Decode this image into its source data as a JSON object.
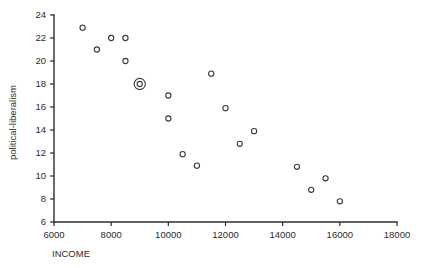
{
  "chart_data": {
    "type": "scatter",
    "title": "",
    "xlabel": "INCOME",
    "ylabel": "political-liberalism",
    "xlim": [
      6000,
      18000
    ],
    "ylim": [
      6,
      24
    ],
    "xticks": [
      6000,
      8000,
      10000,
      12000,
      14000,
      16000,
      18000
    ],
    "yticks": [
      6,
      8,
      10,
      12,
      14,
      16,
      18,
      20,
      22,
      24
    ],
    "grid": false,
    "legend": null,
    "marker": "open-circle",
    "points": [
      {
        "x": 7000,
        "y": 22.9,
        "highlighted": false
      },
      {
        "x": 7500,
        "y": 21.0,
        "highlighted": false
      },
      {
        "x": 8000,
        "y": 22.0,
        "highlighted": false
      },
      {
        "x": 8500,
        "y": 22.0,
        "highlighted": false
      },
      {
        "x": 8500,
        "y": 20.0,
        "highlighted": false
      },
      {
        "x": 9000,
        "y": 18.0,
        "highlighted": true
      },
      {
        "x": 10000,
        "y": 17.0,
        "highlighted": false
      },
      {
        "x": 10000,
        "y": 15.0,
        "highlighted": false
      },
      {
        "x": 10500,
        "y": 11.9,
        "highlighted": false
      },
      {
        "x": 11000,
        "y": 10.9,
        "highlighted": false
      },
      {
        "x": 11500,
        "y": 18.9,
        "highlighted": false
      },
      {
        "x": 12000,
        "y": 15.9,
        "highlighted": false
      },
      {
        "x": 12500,
        "y": 12.8,
        "highlighted": false
      },
      {
        "x": 13000,
        "y": 13.9,
        "highlighted": false
      },
      {
        "x": 14500,
        "y": 10.8,
        "highlighted": false
      },
      {
        "x": 15000,
        "y": 8.8,
        "highlighted": false
      },
      {
        "x": 15500,
        "y": 9.8,
        "highlighted": false
      },
      {
        "x": 16000,
        "y": 7.8,
        "highlighted": false
      }
    ],
    "colors": {
      "axis": "#2b2b2b",
      "marker": "#3a3a3a",
      "background": "#ffffff"
    }
  }
}
